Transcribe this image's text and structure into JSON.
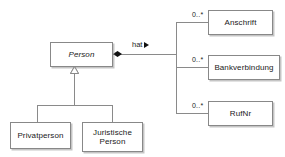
{
  "diagram": {
    "type": "uml-class-diagram",
    "title": "",
    "background_color": "#ffffff",
    "line_color": "#8a8a8a",
    "text_color": "#1a1a1a"
  },
  "classes": {
    "person": {
      "name": "Person",
      "abstract": true
    },
    "privatperson": {
      "name": "Privatperson",
      "abstract": false
    },
    "juristische_person": {
      "name": "Juristische\nPerson",
      "abstract": false
    },
    "anschrift": {
      "name": "Anschrift",
      "abstract": false
    },
    "bankverbindung": {
      "name": "Bankverbindung",
      "abstract": false
    },
    "rufnr": {
      "name": "RufNr",
      "abstract": false
    }
  },
  "associations": {
    "hat": {
      "label": "hat",
      "direction_marker": "▶",
      "source": "Person",
      "kind": "composition"
    },
    "multiplicities": {
      "anschrift": "0..*",
      "bankverbindung": "0..*",
      "rufnr": "0..*"
    }
  },
  "generalization": {
    "parent": "Person",
    "children": [
      "Privatperson",
      "Juristische Person"
    ],
    "marker": "hollow-triangle"
  }
}
